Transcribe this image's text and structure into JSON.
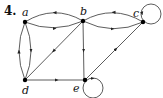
{
  "problem": {
    "number": "4."
  },
  "graph": {
    "type": "directed",
    "nodes": [
      {
        "id": "a",
        "label": "a",
        "x": 25,
        "y": 22
      },
      {
        "id": "b",
        "label": "b",
        "x": 83,
        "y": 21
      },
      {
        "id": "c",
        "label": "c",
        "x": 143,
        "y": 22
      },
      {
        "id": "d",
        "label": "d",
        "x": 25,
        "y": 80
      },
      {
        "id": "e",
        "label": "e",
        "x": 85,
        "y": 80
      }
    ],
    "edges": [
      {
        "from": "a",
        "to": "b"
      },
      {
        "from": "b",
        "to": "a"
      },
      {
        "from": "b",
        "to": "c"
      },
      {
        "from": "c",
        "to": "b"
      },
      {
        "from": "a",
        "to": "d"
      },
      {
        "from": "d",
        "to": "a"
      },
      {
        "from": "b",
        "to": "d"
      },
      {
        "from": "b",
        "to": "e"
      },
      {
        "from": "d",
        "to": "e"
      },
      {
        "from": "e",
        "to": "c"
      },
      {
        "from": "c",
        "to": "c"
      },
      {
        "from": "e",
        "to": "e"
      }
    ],
    "colors": {
      "edge": "#333333",
      "node": "#000000"
    }
  }
}
